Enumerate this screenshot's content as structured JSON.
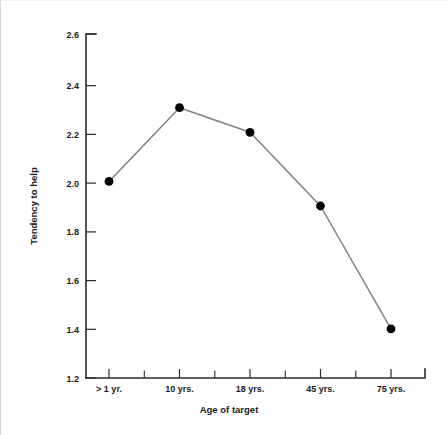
{
  "chart_data": {
    "type": "line",
    "title": "",
    "subtitle": "",
    "xlabel": "Age of target",
    "ylabel": "Tendency to help",
    "categories": [
      "> 1 yr.",
      "10 yrs.",
      "18 yrs.",
      "45 yrs.",
      "75 yrs."
    ],
    "values": [
      2.0,
      2.3,
      2.2,
      1.9,
      1.4
    ],
    "series": [
      {
        "name": "Tendency to help",
        "values": [
          2.0,
          2.3,
          2.2,
          1.9,
          1.4
        ]
      }
    ],
    "ylim": [
      1.2,
      2.6
    ],
    "ytick_labels": [
      "1.2",
      "1.4",
      "1.6",
      "1.8",
      "2.0",
      "2.2",
      "2.4",
      "2.6"
    ],
    "ytick_values": [
      1.2,
      1.4,
      1.6,
      1.8,
      2.0,
      2.2,
      2.4,
      2.6
    ],
    "ytick_step": 0.2,
    "xtick_labels": [
      "> 1 yr.",
      "10 yrs.",
      "18 yrs.",
      "45 yrs.",
      "75 yrs."
    ],
    "minor_xticks_between_majors": 1,
    "grid": false,
    "legend": false,
    "legend_position": "none",
    "marker": "circle",
    "line_color": "#808080",
    "marker_color": "#000000",
    "axis_color": "#2b2b2b",
    "background_color": "#ffffff",
    "annotations": []
  },
  "axis": {
    "y_title": "Tendency to help",
    "x_title": "Age of target"
  },
  "y_labels": {
    "t0": "1.2",
    "t1": "1.4",
    "t2": "1.6",
    "t3": "1.8",
    "t4": "2.0",
    "t5": "2.2",
    "t6": "2.4",
    "t7": "2.6"
  },
  "x_labels": {
    "c0": "> 1 yr.",
    "c1": "10 yrs.",
    "c2": "18 yrs.",
    "c3": "45 yrs.",
    "c4": "75 yrs."
  }
}
